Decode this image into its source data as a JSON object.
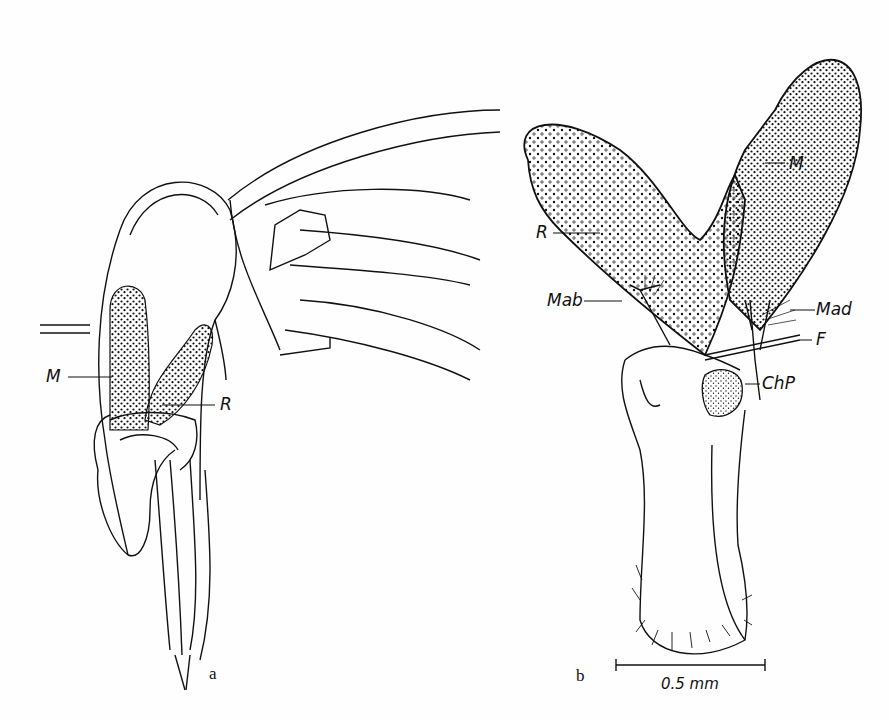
{
  "figure": {
    "panels": [
      {
        "letter": "a",
        "labels": {
          "M": "M",
          "R": "R"
        }
      },
      {
        "letter": "b",
        "labels": {
          "M": "M",
          "R": "R",
          "Mab": "Mab",
          "Mad": "Mad",
          "F": "F",
          "ChP": "ChP"
        }
      }
    ],
    "scale_bar": {
      "label": "0.5 mm"
    }
  },
  "colors": {
    "ink": "#111111",
    "paper": "#fefefe"
  }
}
